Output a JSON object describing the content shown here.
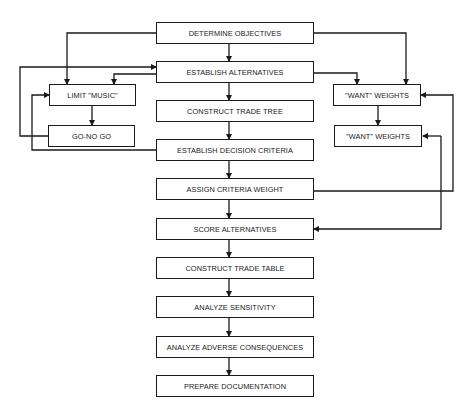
{
  "diagram": {
    "type": "flowchart",
    "main_flow": [
      {
        "id": "determine_objectives",
        "label": "DETERMINE OBJECTIVES"
      },
      {
        "id": "establish_alternatives",
        "label": "ESTABLISH ALTERNATIVES"
      },
      {
        "id": "construct_trade_tree",
        "label": "CONSTRUCT TRADE TREE"
      },
      {
        "id": "establish_decision_criteria",
        "label": "ESTABLISH DECISION CRITERIA"
      },
      {
        "id": "assign_criteria_weight",
        "label": "ASSIGN CRITERIA WEIGHT"
      },
      {
        "id": "score_alternatives",
        "label": "SCORE ALTERNATIVES"
      },
      {
        "id": "construct_trade_table",
        "label": "CONSTRUCT TRADE TABLE"
      },
      {
        "id": "analyze_sensitivity",
        "label": "ANALYZE SENSITIVITY"
      },
      {
        "id": "analyze_adverse_consequences",
        "label": "ANALYZE ADVERSE CONSEQUENCES"
      },
      {
        "id": "prepare_documentation",
        "label": "PREPARE DOCUMENTATION"
      }
    ],
    "left_branch": [
      {
        "id": "limit_music",
        "label": "LIMIT \"MUSIC\""
      },
      {
        "id": "go_no_go",
        "label": "GO-NO GO"
      }
    ],
    "right_branch": [
      {
        "id": "want_weights_1",
        "label": "\"WANT\" WEIGHTS"
      },
      {
        "id": "want_weights_2",
        "label": "\"WANT\" WEIGHTS"
      }
    ],
    "edges": [
      [
        "determine_objectives",
        "establish_alternatives"
      ],
      [
        "establish_alternatives",
        "construct_trade_tree"
      ],
      [
        "construct_trade_tree",
        "establish_decision_criteria"
      ],
      [
        "establish_decision_criteria",
        "assign_criteria_weight"
      ],
      [
        "assign_criteria_weight",
        "score_alternatives"
      ],
      [
        "score_alternatives",
        "construct_trade_table"
      ],
      [
        "construct_trade_table",
        "analyze_sensitivity"
      ],
      [
        "analyze_sensitivity",
        "analyze_adverse_consequences"
      ],
      [
        "analyze_adverse_consequences",
        "prepare_documentation"
      ],
      [
        "determine_objectives",
        "limit_music"
      ],
      [
        "establish_alternatives",
        "limit_music"
      ],
      [
        "limit_music",
        "go_no_go"
      ],
      [
        "go_no_go",
        "establish_alternatives"
      ],
      [
        "establish_decision_criteria",
        "limit_music"
      ],
      [
        "determine_objectives",
        "want_weights_1"
      ],
      [
        "establish_alternatives",
        "want_weights_1"
      ],
      [
        "want_weights_1",
        "want_weights_2"
      ],
      [
        "assign_criteria_weight",
        "want_weights_1"
      ],
      [
        "want_weights_2",
        "score_alternatives"
      ]
    ],
    "colors": {
      "line": "#1a1a1a",
      "box_fill": "#ffffff",
      "background": "#ffffff"
    }
  }
}
